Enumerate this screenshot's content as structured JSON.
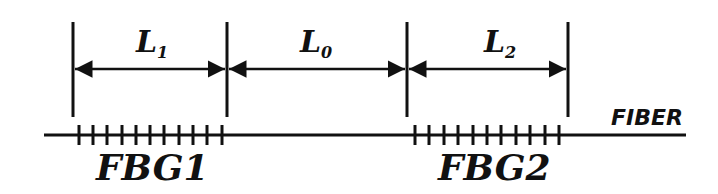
{
  "diagram": {
    "segments": [
      {
        "label": "L",
        "sub": "1"
      },
      {
        "label": "L",
        "sub": "0"
      },
      {
        "label": "L",
        "sub": "2"
      }
    ],
    "fiber_label": "FIBER",
    "gratings": [
      {
        "label": "FBG1"
      },
      {
        "label": "FBG2"
      }
    ],
    "colors": {
      "stroke": "#111111",
      "background": "#ffffff"
    }
  }
}
